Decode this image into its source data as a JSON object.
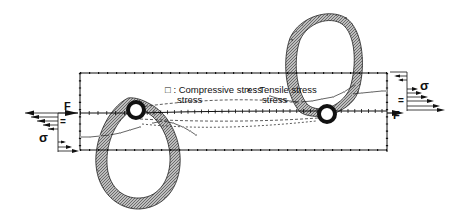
{
  "diagram": {
    "type": "stress-distribution",
    "legend": [
      {
        "marker": "□",
        "label_line1": "Compressive",
        "label_line2": "stress",
        "full": "□ : Compressive stress"
      },
      {
        "marker": "×",
        "label_line1": "Tensile",
        "label_line2": "stress",
        "full": "× : Tensile stress"
      }
    ],
    "loads": {
      "left": {
        "force_label": "F",
        "stress_label": "σ",
        "equals": "="
      },
      "right": {
        "force_label": "F",
        "stress_label": "σ",
        "equals": "="
      }
    },
    "colors": {
      "line": "#1a1a1a",
      "hatch": "#9a9a9a",
      "background": "#ffffff"
    }
  }
}
